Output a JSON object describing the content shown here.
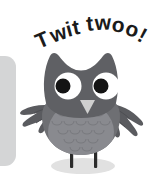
{
  "scene": {
    "title": "Owl illustration with speech text",
    "background_color": "#ffffff",
    "width": 162,
    "height": 177
  },
  "speech": {
    "text": "Twit twoo!",
    "color": "#1b1b1b",
    "style": "bold arched handwritten"
  },
  "left_panel": {
    "name": "rounded grey panel edge",
    "color": "#d4d5d6"
  },
  "owl": {
    "body_color": "#6e6f73",
    "belly_color": "#8a8b90",
    "head_color": "#5f6064",
    "wing_color": "#5a5b5f",
    "eye_white_color": "#ffffff",
    "pupil_color": "#141414",
    "beak_color": "#cfcfcf",
    "leg_color": "#2b2b2b",
    "shadow_color": "#dcdcdc",
    "parts": [
      "ear-tuft-left",
      "ear-tuft-right",
      "head",
      "eye-left",
      "eye-right",
      "beak",
      "body",
      "belly",
      "wing-left",
      "wing-right",
      "leg-left",
      "leg-right",
      "shadow"
    ]
  }
}
